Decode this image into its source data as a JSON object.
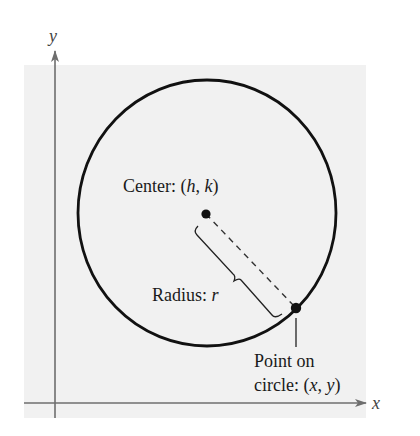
{
  "diagram": {
    "type": "circle-standard-form",
    "colors": {
      "background": "#ffffff",
      "panel": "#f1f1f1",
      "axis": "#6e6e6e",
      "circle": "#111111",
      "text": "#1a1a1a"
    },
    "axes": {
      "x_label": "x",
      "y_label": "y"
    },
    "labels": {
      "center_prefix": "Center: (",
      "center_h": "h",
      "center_sep": ", ",
      "center_k": "k",
      "center_suffix": ")",
      "radius_prefix": "Radius: ",
      "radius_r": "r",
      "point_line1": "Point on",
      "point_prefix": "circle: (",
      "point_x": "x",
      "point_sep": ", ",
      "point_y": "y",
      "point_suffix": ")"
    },
    "geometry": {
      "panel": {
        "x": 24,
        "y": 65,
        "width": 342,
        "height": 353
      },
      "circle": {
        "cx": 207,
        "cy": 213,
        "rx": 129,
        "ry": 133
      },
      "center_point": {
        "x": 206,
        "y": 214
      },
      "point_on_circle": {
        "x": 296,
        "y": 308
      }
    }
  }
}
